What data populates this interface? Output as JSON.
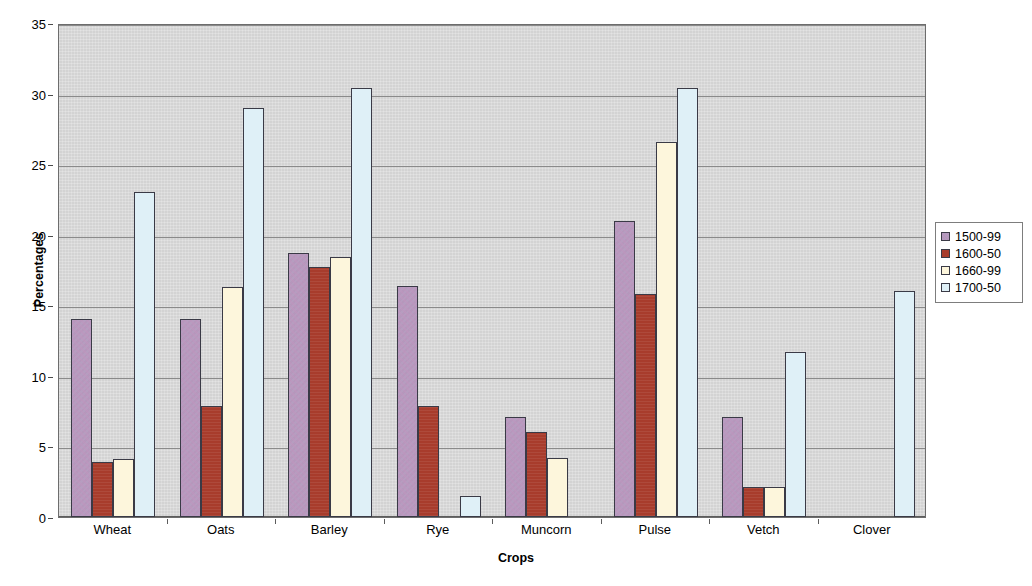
{
  "chart_data": {
    "type": "bar",
    "title": "",
    "xlabel": "Crops",
    "ylabel": "Percentages",
    "ylim": [
      0,
      35
    ],
    "ytick_step": 5,
    "yticks": [
      0,
      5,
      10,
      15,
      20,
      25,
      30,
      35
    ],
    "grid": true,
    "legend_position": "right",
    "categories": [
      "Wheat",
      "Oats",
      "Barley",
      "Rye",
      "Muncorn",
      "Pulse",
      "Vetch",
      "Clover"
    ],
    "series": [
      {
        "name": "1500-99",
        "color": "#b69dc0",
        "values": [
          14.0,
          14.0,
          18.7,
          16.4,
          7.1,
          21.0,
          7.1,
          null
        ]
      },
      {
        "name": "1600-50",
        "color": "#a83c2c",
        "values": [
          3.9,
          7.9,
          17.7,
          7.9,
          6.0,
          15.8,
          2.1,
          null
        ]
      },
      {
        "name": "1660-99",
        "color": "#fdf6dc",
        "values": [
          4.1,
          16.3,
          18.4,
          null,
          4.2,
          26.6,
          2.1,
          null
        ]
      },
      {
        "name": "1700-50",
        "color": "#dff0f7",
        "values": [
          23.0,
          29.0,
          30.4,
          1.5,
          null,
          30.4,
          11.7,
          16.0
        ]
      }
    ]
  },
  "plot": {
    "background_color": "#d3d3d3",
    "gridline_color": "#8a8a8a",
    "border_color": "#6d6d6d",
    "page_background": "#ffffff"
  },
  "legend": {
    "entries": [
      "1500-99",
      "1600-50",
      "1660-99",
      "1700-50"
    ]
  }
}
